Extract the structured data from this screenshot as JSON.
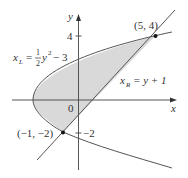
{
  "diagram": {
    "axes": {
      "x_label": "x",
      "y_label": "y",
      "origin_label": "0",
      "y_tick_top": "4",
      "y_tick_bottom": "−2"
    },
    "curves": {
      "left": {
        "name": "x_L",
        "lhs_var": "x",
        "lhs_sub": "L",
        "equals": "=",
        "frac_num": "1",
        "frac_den": "2",
        "rhs": "y",
        "power": "2",
        "tail": "− 3"
      },
      "right": {
        "name": "x_R",
        "lhs_var": "x",
        "lhs_sub": "R",
        "rhs": "= y + 1"
      }
    },
    "points": [
      {
        "label": "(5, 4)",
        "x": 5,
        "y": 4
      },
      {
        "label": "(−1, −2)",
        "x": -1,
        "y": -2
      }
    ],
    "colors": {
      "shading": "#d9d9d9",
      "curve": "#555555",
      "axis": "#444444",
      "point": "#111111"
    }
  }
}
